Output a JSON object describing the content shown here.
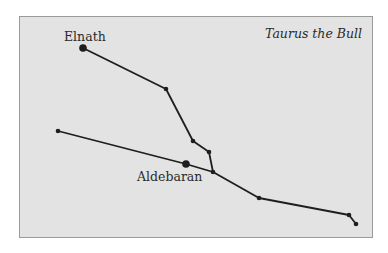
{
  "title": "Taurus the Bull",
  "labels": {
    "elnath": "Elnath",
    "aldebaran": "Aldebaran"
  },
  "colors": {
    "background": "#e3e3e3",
    "border": "#9a9a9a",
    "line": "#1e1e1e",
    "text": "#2a2a2a"
  },
  "stars": [
    {
      "id": "elnath",
      "x": 83,
      "y": 48,
      "size": "large"
    },
    {
      "id": "s1",
      "x": 166,
      "y": 89,
      "size": "small"
    },
    {
      "id": "s2",
      "x": 193,
      "y": 141,
      "size": "small"
    },
    {
      "id": "s3",
      "x": 209,
      "y": 152,
      "size": "small"
    },
    {
      "id": "s4",
      "x": 213,
      "y": 172,
      "size": "small"
    },
    {
      "id": "aldebaran",
      "x": 186,
      "y": 164,
      "size": "large"
    },
    {
      "id": "s5",
      "x": 58,
      "y": 131,
      "size": "small"
    },
    {
      "id": "s6",
      "x": 259,
      "y": 198,
      "size": "small"
    },
    {
      "id": "s7",
      "x": 349,
      "y": 215,
      "size": "small"
    },
    {
      "id": "s8",
      "x": 356,
      "y": 224,
      "size": "small"
    }
  ],
  "lines": [
    [
      "elnath",
      "s1"
    ],
    [
      "s1",
      "s2"
    ],
    [
      "s2",
      "s3"
    ],
    [
      "s3",
      "s4"
    ],
    [
      "s5",
      "aldebaran"
    ],
    [
      "aldebaran",
      "s4"
    ],
    [
      "s4",
      "s6"
    ],
    [
      "s6",
      "s7"
    ],
    [
      "s7",
      "s8"
    ]
  ]
}
